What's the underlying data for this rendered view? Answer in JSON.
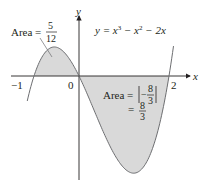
{
  "figure": {
    "equation": "y = x³ − x² − 2x",
    "equation_parts": {
      "lhs": "y = x",
      "exp1": "3",
      "mid": " − x",
      "exp2": "2",
      "rhs": " − 2x"
    },
    "axis_labels": {
      "x": "x",
      "y": "y"
    },
    "ticks": {
      "neg_one": "−1",
      "zero": "0",
      "two": "2"
    },
    "area_left": {
      "prefix": "Area =",
      "numerator": "5",
      "denominator": "12"
    },
    "area_right": {
      "prefix": "Area =",
      "abs_num": "8",
      "abs_den": "3",
      "minus": "−",
      "eq": "=",
      "num": "8",
      "den": "3"
    },
    "colors": {
      "shade": "#d9d9d9",
      "curve": "#6d6e71",
      "axis": "#231f20"
    }
  },
  "chart_data": {
    "type": "area",
    "title": "",
    "function": "y = x^3 - x^2 - 2x",
    "x_range": [
      -1.15,
      2.1
    ],
    "shaded_regions": [
      {
        "x_from": -1,
        "x_to": 0,
        "area": "5/12",
        "sign": "positive"
      },
      {
        "x_from": 0,
        "x_to": 2,
        "area": "8/3",
        "signed_integral": "-8/3",
        "sign": "negative"
      }
    ],
    "xlabel": "x",
    "ylabel": "y",
    "x_tick_labels": [
      "-1",
      "0",
      "2"
    ],
    "roots": [
      -1,
      0,
      2
    ]
  }
}
